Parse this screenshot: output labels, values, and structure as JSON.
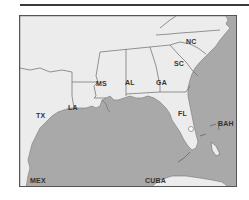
{
  "map": {
    "title": "Southeastern United States",
    "colors": {
      "land": "#ececec",
      "water": "#a9a9a9",
      "border": "#6a6a6a",
      "frame": "#555555",
      "label": "#333333"
    },
    "labels": {
      "nc": "NC",
      "sc": "SC",
      "ga": "GA",
      "al": "AL",
      "ms": "MS",
      "la": "LA",
      "tx": "TX",
      "fl": "FL",
      "bah": "BAH",
      "mex": "MEX",
      "cuba": "CUBA"
    }
  }
}
